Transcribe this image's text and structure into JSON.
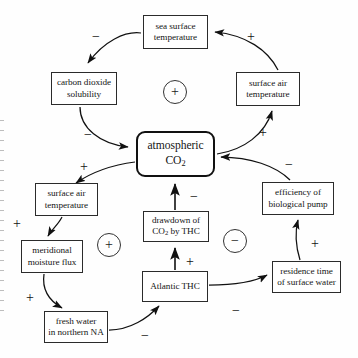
{
  "diagram": {
    "type": "causal-loop",
    "nodes": [
      {
        "id": "sea-surface-temperature",
        "label": "sea surface\ntemperature",
        "line1": "sea surface",
        "line2": "temperature",
        "x": 143,
        "y": 15,
        "w": 65,
        "h": 34
      },
      {
        "id": "carbon-dioxide-solubility",
        "label": "carbon dioxide\nsolubility",
        "line1": "carbon dioxide",
        "line2": "solubility",
        "x": 51,
        "y": 72,
        "w": 66,
        "h": 33
      },
      {
        "id": "surface-air-temperature-upper",
        "label": "surface air\ntemperature",
        "line1": "surface air",
        "line2": "temperature",
        "x": 236,
        "y": 72,
        "w": 64,
        "h": 34
      },
      {
        "id": "atmospheric-co2",
        "label": "atmospheric CO2",
        "line1": "atmospheric",
        "line2": "CO",
        "sub": "2",
        "x": 136,
        "y": 131,
        "w": 79,
        "h": 46
      },
      {
        "id": "surface-air-temperature-lower",
        "label": "surface air\ntemperature",
        "line1": "surface air",
        "line2": "temperature",
        "x": 35,
        "y": 183,
        "w": 63,
        "h": 33
      },
      {
        "id": "meridional-moisture-flux",
        "label": "meridional\nmoisture flux",
        "line1": "meridional",
        "line2": "moisture flux",
        "x": 21,
        "y": 240,
        "w": 62,
        "h": 33
      },
      {
        "id": "fresh-water-northern-na",
        "label": "fresh water\nin northern NA",
        "line1": "fresh water",
        "line2": "in northern NA",
        "x": 44,
        "y": 311,
        "w": 64,
        "h": 32
      },
      {
        "id": "drawdown-co2-by-thc",
        "label": "drawdown of CO2 by THC",
        "line1": "drawdown of",
        "line2": "CO",
        "sub": "2",
        "line2b": " by THC",
        "x": 143,
        "y": 211,
        "w": 66,
        "h": 31
      },
      {
        "id": "atlantic-thc",
        "label": "Atlantic THC",
        "line1": "Atlantic THC",
        "x": 142,
        "y": 271,
        "w": 66,
        "h": 31
      },
      {
        "id": "efficiency-biological-pump",
        "label": "efficiency of\nbiological pump",
        "line1": "efficiency of",
        "line2": "biological pump",
        "x": 262,
        "y": 182,
        "w": 72,
        "h": 33
      },
      {
        "id": "residence-time-surface-water",
        "label": "residence time\nof surface water",
        "line1": "residence time",
        "line2": "of surface water",
        "x": 272,
        "y": 261,
        "w": 69,
        "h": 32
      }
    ],
    "edge_signs": [
      {
        "id": "sign-sst-to-solubility",
        "text": "−",
        "x": 92,
        "y": 30
      },
      {
        "id": "sign-sat-to-sst",
        "text": "+",
        "x": 247,
        "y": 30
      },
      {
        "id": "sign-solubility-to-co2",
        "text": "−",
        "x": 84,
        "y": 128
      },
      {
        "id": "sign-co2-to-sat-upper",
        "text": "+",
        "x": 259,
        "y": 126
      },
      {
        "id": "sign-co2-to-sat-lower",
        "text": "+",
        "x": 80,
        "y": 160
      },
      {
        "id": "sign-pump-to-co2",
        "text": "−",
        "x": 285,
        "y": 158
      },
      {
        "id": "sign-sat-to-moisture",
        "text": "+",
        "x": 13,
        "y": 217
      },
      {
        "id": "sign-drawdown-to-co2",
        "text": "−",
        "x": 190,
        "y": 190
      },
      {
        "id": "sign-moisture-to-freshwater",
        "text": "+",
        "x": 26,
        "y": 291
      },
      {
        "id": "sign-thc-to-drawdown",
        "text": "+",
        "x": 186,
        "y": 255
      },
      {
        "id": "sign-residence-to-pump",
        "text": "+",
        "x": 311,
        "y": 237
      },
      {
        "id": "sign-thc-to-residence",
        "text": "−",
        "x": 232,
        "y": 304
      },
      {
        "id": "sign-freshwater-to-thc",
        "text": "−",
        "x": 141,
        "y": 329
      }
    ],
    "loop_markers": [
      {
        "id": "loop-marker-top",
        "text": "+",
        "cx": 174,
        "cy": 91
      },
      {
        "id": "loop-marker-left",
        "text": "+",
        "cx": 108,
        "cy": 244
      },
      {
        "id": "loop-marker-right",
        "text": "−",
        "cx": 234,
        "cy": 240
      }
    ],
    "colors": {
      "stroke": "#1a1a1a",
      "box_border": "#2b2b2b",
      "background": "#ffffff",
      "text": "#151515"
    }
  }
}
